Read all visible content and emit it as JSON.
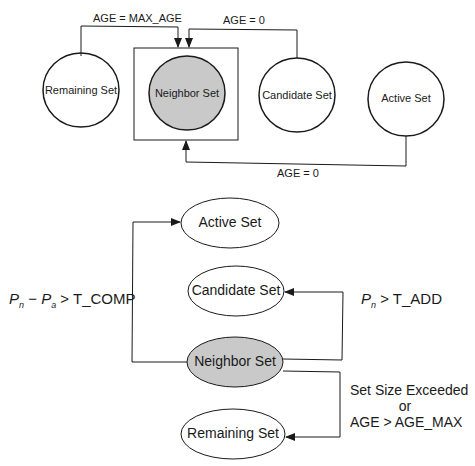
{
  "top_diagram": {
    "nodes": [
      {
        "id": "remaining",
        "label": "Remaining Set",
        "shaded": false
      },
      {
        "id": "neighbor",
        "label": "Neighbor Set",
        "shaded": true
      },
      {
        "id": "candidate",
        "label": "Candidate Set",
        "shaded": false
      },
      {
        "id": "active",
        "label": "Active Set",
        "shaded": false
      }
    ],
    "edges": [
      {
        "from": "remaining",
        "to": "neighbor",
        "label": "AGE = MAX_AGE"
      },
      {
        "from": "candidate",
        "to": "neighbor",
        "label": "AGE = 0"
      },
      {
        "from": "active",
        "to": "neighbor",
        "label": "AGE = 0"
      }
    ]
  },
  "bottom_diagram": {
    "nodes": [
      {
        "id": "active",
        "label": "Active Set",
        "shaded": false
      },
      {
        "id": "candidate",
        "label": "Candidate Set",
        "shaded": false
      },
      {
        "id": "neighbor",
        "label": "Neighbor Set",
        "shaded": true
      },
      {
        "id": "remaining",
        "label": "Remaining Set",
        "shaded": false
      }
    ],
    "edges": [
      {
        "from": "neighbor",
        "to": "active",
        "label_parts": {
          "p1": "P",
          "s1": "n",
          "minus": " − ",
          "p2": "P",
          "s2": "a",
          "rest": " > T_COMP"
        }
      },
      {
        "from": "neighbor",
        "to": "candidate",
        "label_parts": {
          "p1": "P",
          "s1": "n",
          "rest": " > T_ADD"
        }
      },
      {
        "from": "neighbor",
        "to": "remaining",
        "label_lines": [
          "Set Size Exceeded",
          "or",
          "AGE > AGE_MAX"
        ]
      }
    ]
  },
  "colors": {
    "line": "#1a1a1a",
    "shade": "#c9c9c9",
    "background": "#ffffff"
  }
}
